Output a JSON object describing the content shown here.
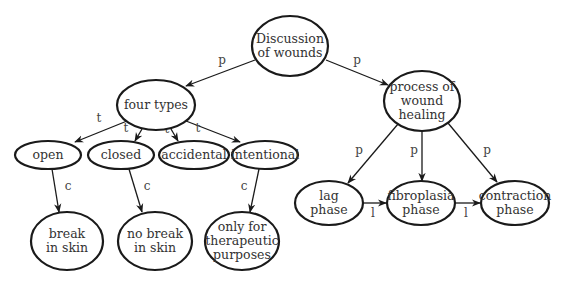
{
  "diagram": {
    "type": "concept-map",
    "colors": {
      "stroke": "#1a1a1a",
      "text": "#333333",
      "background": "#ffffff"
    },
    "nodes": [
      {
        "id": "root",
        "lines": [
          "Discussion",
          "of wounds"
        ],
        "cx": 290,
        "cy": 46,
        "rx": 38,
        "ry": 30
      },
      {
        "id": "four_types",
        "lines": [
          "four types"
        ],
        "cx": 156,
        "cy": 105,
        "rx": 39,
        "ry": 25
      },
      {
        "id": "process",
        "lines": [
          "process of",
          "wound",
          "healing"
        ],
        "cx": 422,
        "cy": 101,
        "rx": 38,
        "ry": 30
      },
      {
        "id": "open",
        "lines": [
          "open"
        ],
        "cx": 48,
        "cy": 155,
        "rx": 33,
        "ry": 14
      },
      {
        "id": "closed",
        "lines": [
          "closed"
        ],
        "cx": 121,
        "cy": 155,
        "rx": 33,
        "ry": 14
      },
      {
        "id": "accidental",
        "lines": [
          "accidental"
        ],
        "cx": 194,
        "cy": 155,
        "rx": 35,
        "ry": 14
      },
      {
        "id": "intentional",
        "lines": [
          "intentional"
        ],
        "cx": 265,
        "cy": 155,
        "rx": 33,
        "ry": 14
      },
      {
        "id": "break",
        "lines": [
          "break",
          "in skin"
        ],
        "cx": 67,
        "cy": 241,
        "rx": 36,
        "ry": 29
      },
      {
        "id": "no_break",
        "lines": [
          "no break",
          "in skin"
        ],
        "cx": 155,
        "cy": 241,
        "rx": 37,
        "ry": 29
      },
      {
        "id": "therapeutic",
        "lines": [
          "only for",
          "therapeutic",
          "purposes"
        ],
        "cx": 242,
        "cy": 241,
        "rx": 37,
        "ry": 29
      },
      {
        "id": "lag",
        "lines": [
          "lag",
          "phase"
        ],
        "cx": 329,
        "cy": 203,
        "rx": 34,
        "ry": 22
      },
      {
        "id": "fibroplasia",
        "lines": [
          "fibroplasia",
          "phase"
        ],
        "cx": 421,
        "cy": 203,
        "rx": 34,
        "ry": 22
      },
      {
        "id": "contraction",
        "lines": [
          "contraction",
          "phase"
        ],
        "cx": 515,
        "cy": 203,
        "rx": 34,
        "ry": 22
      }
    ],
    "edges": [
      {
        "from": "root",
        "to": "four_types",
        "label": "p",
        "x1": 255,
        "y1": 60,
        "x2": 186,
        "y2": 86,
        "lx": 222,
        "ly": 64
      },
      {
        "from": "root",
        "to": "process",
        "label": "p",
        "x1": 326,
        "y1": 60,
        "x2": 388,
        "y2": 85,
        "lx": 357,
        "ly": 64
      },
      {
        "from": "four_types",
        "to": "open",
        "label": "t",
        "x1": 127,
        "y1": 121,
        "x2": 75,
        "y2": 142,
        "lx": 99,
        "ly": 122
      },
      {
        "from": "four_types",
        "to": "closed",
        "label": "t",
        "x1": 142,
        "y1": 129,
        "x2": 135,
        "y2": 141,
        "lx": 126,
        "ly": 132
      },
      {
        "from": "four_types",
        "to": "accidental",
        "label": "t",
        "x1": 171,
        "y1": 129,
        "x2": 178,
        "y2": 141,
        "lx": 167,
        "ly": 133
      },
      {
        "from": "four_types",
        "to": "intentional",
        "label": "t",
        "x1": 186,
        "y1": 121,
        "x2": 240,
        "y2": 142,
        "lx": 198,
        "ly": 132
      },
      {
        "from": "open",
        "to": "break",
        "label": "c",
        "x1": 52,
        "y1": 169,
        "x2": 59,
        "y2": 212,
        "lx": 68,
        "ly": 190
      },
      {
        "from": "closed",
        "to": "no_break",
        "label": "c",
        "x1": 129,
        "y1": 169,
        "x2": 142,
        "y2": 212,
        "lx": 147,
        "ly": 190
      },
      {
        "from": "intentional",
        "to": "therapeutic",
        "label": "c",
        "x1": 259,
        "y1": 169,
        "x2": 250,
        "y2": 212,
        "lx": 244,
        "ly": 190
      },
      {
        "from": "process",
        "to": "lag",
        "label": "p",
        "x1": 398,
        "y1": 124,
        "x2": 348,
        "y2": 183,
        "lx": 359,
        "ly": 154
      },
      {
        "from": "process",
        "to": "fibroplasia",
        "label": "p",
        "x1": 422,
        "y1": 131,
        "x2": 422,
        "y2": 181,
        "lx": 414,
        "ly": 154
      },
      {
        "from": "process",
        "to": "contraction",
        "label": "p",
        "x1": 448,
        "y1": 123,
        "x2": 497,
        "y2": 182,
        "lx": 487,
        "ly": 154
      },
      {
        "from": "lag",
        "to": "fibroplasia",
        "label": "l",
        "x1": 363,
        "y1": 203,
        "x2": 386,
        "y2": 203,
        "lx": 373,
        "ly": 217
      },
      {
        "from": "fibroplasia",
        "to": "contraction",
        "label": "l",
        "x1": 455,
        "y1": 203,
        "x2": 480,
        "y2": 203,
        "lx": 466,
        "ly": 217
      }
    ]
  }
}
